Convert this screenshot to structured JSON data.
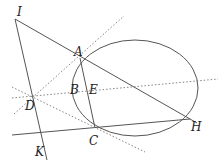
{
  "diagram": {
    "type": "geometry",
    "ellipse": {
      "cx": 135,
      "cy": 88,
      "rx": 63,
      "ry": 48
    },
    "points": {
      "I": {
        "label": "I",
        "x": 15,
        "y": 19
      },
      "A": {
        "label": "A",
        "x": 80,
        "y": 58
      },
      "B": {
        "label": "B",
        "x": 72,
        "y": 95
      },
      "E": {
        "label": "E",
        "x": 88,
        "y": 95
      },
      "D": {
        "label": "D",
        "x": 35,
        "y": 97
      },
      "C": {
        "label": "C",
        "x": 95,
        "y": 128
      },
      "H": {
        "label": "H",
        "x": 190,
        "y": 119
      },
      "K": {
        "label": "K",
        "x": 45,
        "y": 150
      }
    },
    "solid_lines": [
      {
        "from": "I",
        "to": "H"
      },
      {
        "from": "I",
        "to": "K"
      },
      {
        "from": "A",
        "to": "C"
      },
      {
        "from": "K-left",
        "to": "H",
        "note": "line through C and H"
      }
    ],
    "dotted_lines": [
      {
        "through": [
          "D",
          "A"
        ]
      },
      {
        "through": [
          "D",
          "E"
        ]
      },
      {
        "through": [
          "D",
          "C"
        ]
      }
    ]
  }
}
